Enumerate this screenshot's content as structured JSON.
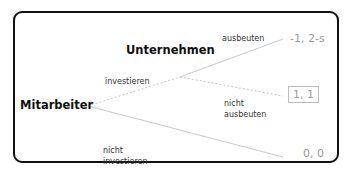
{
  "diagram": {
    "type": "game-tree",
    "players": {
      "first": "Mitarbeiter",
      "second": "Unternehmen"
    },
    "actions": {
      "investieren": "investieren",
      "nicht_investieren_line1": "nicht",
      "nicht_investieren_line2": "investieren",
      "ausbeuten": "ausbeuten",
      "nicht_ausbeuten_line1": "nicht",
      "nicht_ausbeuten_line2": "ausbeuten"
    },
    "payoffs": {
      "ausbeuten": "-1, 2-s",
      "nicht_ausbeuten": "1, 1",
      "nicht_investieren": "0, 0"
    },
    "colors": {
      "frame": "#111111",
      "edge": "#c8c8c8",
      "payoff_text": "#9a9a9a",
      "highlight_box": "#bdbdbd"
    }
  }
}
